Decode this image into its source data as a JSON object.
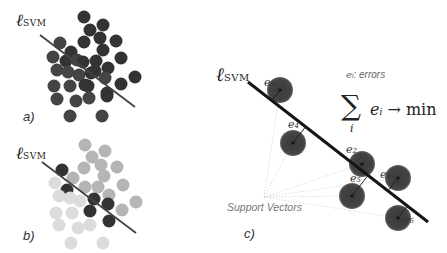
{
  "panels": {
    "a": {
      "label": "a)",
      "line_label": "ℓ",
      "line_label_sub": "SVM",
      "line": {
        "x1": 40,
        "y1": 35,
        "x2": 135,
        "y2": 107
      },
      "points": [
        [
          84,
          17,
          "#333"
        ],
        [
          90,
          30,
          "#333"
        ],
        [
          103,
          25,
          "#333"
        ],
        [
          84,
          42,
          "#333"
        ],
        [
          100,
          38,
          "#333"
        ],
        [
          116,
          41,
          "#333"
        ],
        [
          60,
          43,
          "#444"
        ],
        [
          71,
          52,
          "#333"
        ],
        [
          103,
          50,
          "#333"
        ],
        [
          121,
          58,
          "#333"
        ],
        [
          53,
          57,
          "#444"
        ],
        [
          66,
          61,
          "#333"
        ],
        [
          77,
          60,
          "#444"
        ],
        [
          83,
          62,
          "#333"
        ],
        [
          96,
          61,
          "#333"
        ],
        [
          108,
          68,
          "#333"
        ],
        [
          95,
          71,
          "#333"
        ],
        [
          57,
          70,
          "#444"
        ],
        [
          68,
          72,
          "#444"
        ],
        [
          79,
          75,
          "#444"
        ],
        [
          91,
          73,
          "#333"
        ],
        [
          105,
          78,
          "#444"
        ],
        [
          135,
          77,
          "#333"
        ],
        [
          54,
          86,
          "#444"
        ],
        [
          70,
          86,
          "#444"
        ],
        [
          85,
          85,
          "#333"
        ],
        [
          88,
          86,
          "#333"
        ],
        [
          121,
          84,
          "#333"
        ],
        [
          107,
          93,
          "#333"
        ],
        [
          57,
          99,
          "#444"
        ],
        [
          76,
          101,
          "#444"
        ],
        [
          89,
          98,
          "#444"
        ],
        [
          107,
          96,
          "#333"
        ],
        [
          70,
          116,
          "#444"
        ],
        [
          102,
          116,
          "#444"
        ]
      ]
    },
    "b": {
      "label": "b)",
      "line_label": "ℓ",
      "line_label_sub": "SVM",
      "line": {
        "x1": 42,
        "y1": 162,
        "x2": 136,
        "y2": 233
      },
      "points": [
        [
          85,
          145,
          "#b5b5b5"
        ],
        [
          105,
          151,
          "#b5b5b5"
        ],
        [
          92,
          157,
          "#b5b5b5"
        ],
        [
          84,
          168,
          "#b5b5b5"
        ],
        [
          101,
          165,
          "#b5b5b5"
        ],
        [
          117,
          167,
          "#b5b5b5"
        ],
        [
          62,
          170,
          "#333"
        ],
        [
          73,
          178,
          "#b5b5b5"
        ],
        [
          104,
          176,
          "#b5b5b5"
        ],
        [
          123,
          185,
          "#b5b5b5"
        ],
        [
          55,
          183,
          "#dcdcdc"
        ],
        [
          67,
          190,
          "#333"
        ],
        [
          85,
          187,
          "#b5b5b5"
        ],
        [
          98,
          187,
          "#b5b5b5"
        ],
        [
          94,
          199,
          "#333"
        ],
        [
          109,
          195,
          "#b5b5b5"
        ],
        [
          59,
          196,
          "#dcdcdc"
        ],
        [
          70,
          198,
          "#dcdcdc"
        ],
        [
          80,
          201,
          "#dcdcdc"
        ],
        [
          108,
          204,
          "#333"
        ],
        [
          136,
          202,
          "#b5b5b5"
        ],
        [
          56,
          213,
          "#dcdcdc"
        ],
        [
          72,
          213,
          "#dcdcdc"
        ],
        [
          90,
          211,
          "#333"
        ],
        [
          122,
          210,
          "#b5b5b5"
        ],
        [
          109,
          221,
          "#333"
        ],
        [
          59,
          225,
          "#dcdcdc"
        ],
        [
          78,
          228,
          "#dcdcdc"
        ],
        [
          90,
          225,
          "#dcdcdc"
        ],
        [
          71,
          243,
          "#dcdcdc"
        ],
        [
          103,
          243,
          "#dcdcdc"
        ]
      ]
    },
    "c": {
      "label": "c)",
      "line_label": "ℓ",
      "line_label_sub": "SVM",
      "line": {
        "x1": 248,
        "y1": 82,
        "x2": 428,
        "y2": 222
      },
      "errors_legend": "e",
      "errors_legend_sub": "i",
      "errors_legend_text": ": errors",
      "formula": "∑",
      "formula_sub": "i",
      "formula_rhs_e": "e",
      "formula_rhs_sub": "i",
      "formula_rhs_tail": " → min",
      "support_vectors_label": "Support Vectors",
      "support_vectors": [
        {
          "cx": 280,
          "cy": 90,
          "label": "e",
          "sub": "1",
          "lx": 264,
          "ly": 84
        },
        {
          "cx": 293,
          "cy": 143,
          "label": "e",
          "sub": "4",
          "lx": 288,
          "ly": 126
        },
        {
          "cx": 362,
          "cy": 164,
          "label": "e",
          "sub": "2",
          "lx": 346,
          "ly": 151
        },
        {
          "cx": 398,
          "cy": 178,
          "label": "e",
          "sub": "3",
          "lx": 380,
          "ly": 176
        },
        {
          "cx": 352,
          "cy": 196,
          "label": "e",
          "sub": "5",
          "lx": 350,
          "ly": 180
        },
        {
          "cx": 398,
          "cy": 218,
          "label": "e",
          "sub": "6",
          "lx": 403,
          "ly": 221
        }
      ],
      "sv_origin": {
        "x": 264,
        "y": 197
      }
    }
  }
}
